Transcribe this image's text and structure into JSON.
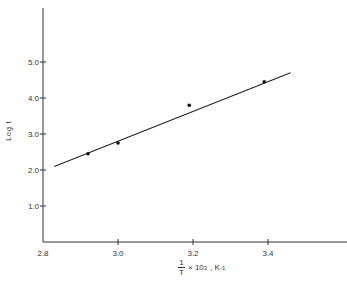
{
  "chart_data": {
    "type": "scatter",
    "title": "",
    "xlabel": "1/T × 10^3, K^-1",
    "ylabel": "Log t",
    "xlim": [
      2.8,
      3.6
    ],
    "ylim": [
      0,
      6.5
    ],
    "grid": false,
    "x_ticks": [
      "2.8",
      "3.0",
      "3.2",
      "3.4"
    ],
    "y_ticks": [
      "1.0",
      "2.0",
      "3.0",
      "4.0",
      "5.0"
    ],
    "series": [
      {
        "name": "data",
        "type": "scatter",
        "x": [
          2.92,
          3.0,
          3.19,
          3.39
        ],
        "y": [
          2.45,
          2.75,
          3.8,
          4.45
        ]
      },
      {
        "name": "fit",
        "type": "line",
        "x": [
          2.83,
          3.46
        ],
        "y": [
          2.1,
          4.7
        ]
      }
    ]
  },
  "labels": {
    "ylabel": "Log t",
    "xlabel_num": "1",
    "xlabel_den": "T",
    "xlabel_rest": "× 10",
    "xlabel_exp": "3",
    "xlabel_unit": ", K",
    "xlabel_unit_exp": "-1"
  }
}
